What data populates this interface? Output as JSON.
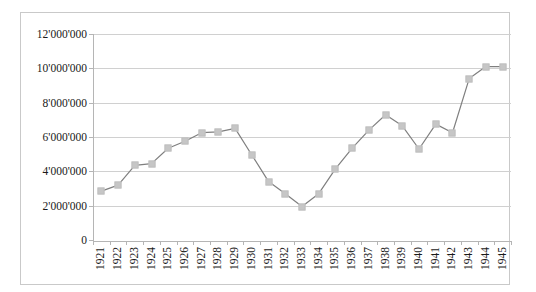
{
  "chart_data": {
    "type": "line",
    "title": "",
    "subtitle": "",
    "xlabel": "",
    "ylabel": "",
    "ylim": [
      0,
      12000000
    ],
    "ytick_step": 2000000,
    "grid": true,
    "legend": false,
    "legend_position": "none",
    "marker": "square",
    "line_color": "#7f7f7f",
    "marker_color": "#c6c6c6",
    "gridline_color": "#d0d0d0",
    "axis_color": "#b5b5b5",
    "border_color": "#c9c9c9",
    "ytick_labels": [
      "12'000'000",
      "10'000'000",
      "8'000'000",
      "6'000'000",
      "4'000'000",
      "2'000'000",
      "0"
    ],
    "ytick_values": [
      12000000,
      10000000,
      8000000,
      6000000,
      4000000,
      2000000,
      0
    ],
    "categories": [
      "1921",
      "1922",
      "1923",
      "1924",
      "1925",
      "1926",
      "1927",
      "1928",
      "1929",
      "1930",
      "1931",
      "1932",
      "1933",
      "1934",
      "1935",
      "1936",
      "1937",
      "1938",
      "1939",
      "1940",
      "1941",
      "1942",
      "1943",
      "1944",
      "1945"
    ],
    "values": [
      2850000,
      3200000,
      4350000,
      4450000,
      5350000,
      5750000,
      6250000,
      6300000,
      6500000,
      4950000,
      3400000,
      2700000,
      1950000,
      2700000,
      4150000,
      5350000,
      6400000,
      7300000,
      6650000,
      5300000,
      6750000,
      6250000,
      9400000,
      10100000,
      10100000
    ]
  }
}
